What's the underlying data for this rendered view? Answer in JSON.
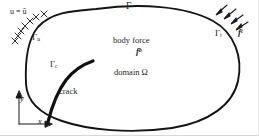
{
  "figure": {
    "background_color": "#ffffff",
    "ink_color": "#1a1a1a"
  },
  "labels": {
    "prescribed_displacement": "u = ū",
    "gamma_u": "Γ",
    "gamma_u_sub": "u",
    "gamma": "Γ",
    "gamma_t": "Γ",
    "gamma_t_sub": "t",
    "traction_force": "f",
    "traction_force_sup": "t",
    "body_force_text": "body force",
    "body_force_symbol": "f",
    "body_force_sup": "b",
    "domain_text": "domain Ω",
    "gamma_c": "Γ",
    "gamma_c_sub": "c",
    "crack_text": "crack",
    "axis_y": "y",
    "axis_x": "x"
  },
  "geometry": {
    "domain_boundary_path": "M 96 9 C 140 3, 186 6, 213 21 C 235 33, 243 58, 238 81 C 233 104, 210 122, 172 128 C 130 134, 88 130, 62 121 C 38 113, 27 101, 26 84 C 25 62, 27 40, 38 27 C 52 12, 72 11, 96 9 Z",
    "crack_path": "M 48 122 C 52 106, 57 92, 66 80 C 74 70, 84 64, 93 61",
    "crack_stroke_width": 3.2,
    "boundary_stroke_width": 1.9,
    "hatch_marks_count": 7,
    "traction_arrows_count": 4
  },
  "elements": {
    "domain_boundary": "domain-boundary",
    "crack": "crack-curve",
    "hatching": "displacement-bc-hatching",
    "arrows": "traction-bc-arrows",
    "axes": "coordinate-axes"
  }
}
